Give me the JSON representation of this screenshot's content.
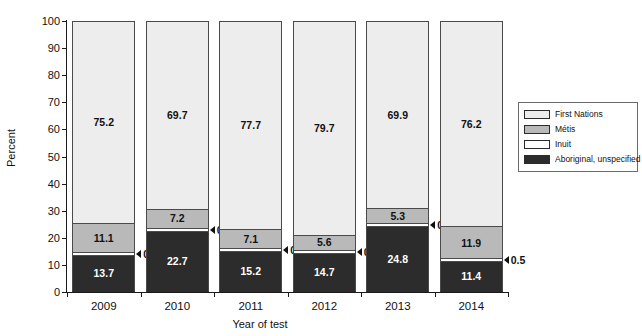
{
  "chart_data": {
    "type": "bar",
    "subtype": "stacked-100-percent",
    "title": "",
    "xlabel": "Year of test",
    "ylabel": "Percent",
    "ylim": [
      0,
      100
    ],
    "yticks": [
      0,
      10,
      20,
      30,
      40,
      50,
      60,
      70,
      80,
      90,
      100
    ],
    "grid": false,
    "legend_position": "right",
    "categories": [
      "2009",
      "2010",
      "2011",
      "2012",
      "2013",
      "2014"
    ],
    "series": [
      {
        "name": "First Nations",
        "color": "#ededed",
        "values": [
          75.2,
          69.7,
          77.7,
          79.7,
          69.9,
          76.2
        ],
        "labels": [
          "75.2",
          "69.7",
          "77.7",
          "79.7",
          "69.9",
          "76.2"
        ],
        "label_inside": [
          true,
          true,
          true,
          true,
          true,
          true
        ]
      },
      {
        "name": "Métis",
        "color": "#b9b9b9",
        "values": [
          11.1,
          7.2,
          7.1,
          5.6,
          5.3,
          11.9
        ],
        "labels": [
          "11.1",
          "7.2",
          "7.1",
          "5.6",
          "5.3",
          "11.9"
        ],
        "label_inside": [
          true,
          true,
          true,
          true,
          true,
          true
        ]
      },
      {
        "name": "Inuit",
        "color": "#ffffff",
        "values": [
          0.0,
          0.4,
          0.0,
          0.0,
          0.0,
          0.5
        ],
        "labels": [
          "0.0",
          "0.4",
          "0.0",
          "0.0",
          "0.0",
          "0.5"
        ],
        "label_inside": [
          false,
          false,
          false,
          false,
          false,
          false
        ]
      },
      {
        "name": "Aboriginal, unspecified",
        "color": "#2c2c2c",
        "values": [
          13.7,
          22.7,
          15.2,
          14.7,
          24.8,
          11.4
        ],
        "labels": [
          "13.7",
          "22.7",
          "15.2",
          "14.7",
          "24.8",
          "11.4"
        ],
        "label_inside": [
          true,
          true,
          true,
          true,
          true,
          true
        ]
      }
    ]
  },
  "axes": {
    "y_title": "Percent",
    "x_title": "Year of test",
    "y_tick_labels": [
      "100",
      "90",
      "80",
      "70",
      "60",
      "50",
      "40",
      "30",
      "20",
      "10",
      "0"
    ],
    "x_tick_labels": [
      "2009",
      "2010",
      "2011",
      "2012",
      "2013",
      "2014"
    ]
  },
  "legend": {
    "items": [
      {
        "label": "First Nations",
        "color": "#ededed"
      },
      {
        "label": "Métis",
        "color": "#b9b9b9"
      },
      {
        "label": "Inuit",
        "color": "#ffffff"
      },
      {
        "label": "Aboriginal, unspecified",
        "color": "#2c2c2c"
      }
    ]
  },
  "callouts": {
    "values": [
      "0.0",
      "0.4",
      "0.0",
      "0.0",
      "0.0",
      "0.5"
    ]
  }
}
